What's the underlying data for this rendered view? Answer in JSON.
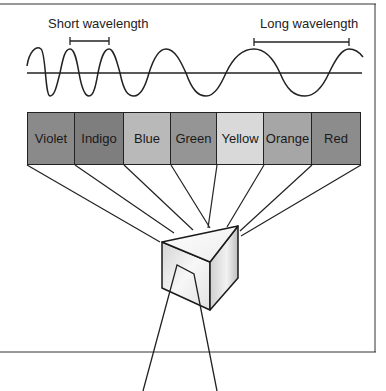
{
  "labels": {
    "short_wavelength": "Short wavelength",
    "long_wavelength": "Long wavelength"
  },
  "spectrum": [
    {
      "name": "Violet",
      "color": "#8a8a8a"
    },
    {
      "name": "Indigo",
      "color": "#7e7e7e"
    },
    {
      "name": "Blue",
      "color": "#b9b9b9"
    },
    {
      "name": "Green",
      "color": "#959595"
    },
    {
      "name": "Yellow",
      "color": "#d9d9d9"
    },
    {
      "name": "Orange",
      "color": "#a6a6a6"
    },
    {
      "name": "Red",
      "color": "#8c8c8c"
    }
  ],
  "colors": {
    "line": "#222222",
    "prism_light": "#f4f4f4",
    "prism_shade": "#cfcfcf"
  }
}
